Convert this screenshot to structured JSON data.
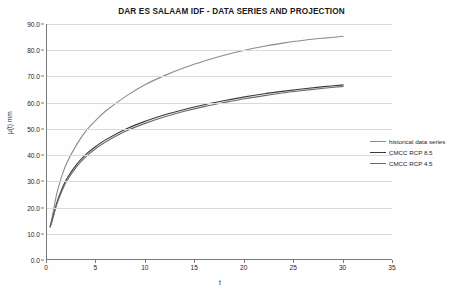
{
  "chart_data": {
    "type": "line",
    "title": "DAR ES SALAAM IDF - DATA SERIES AND PROJECTION",
    "xlabel": "t",
    "ylabel": "μ(t)  mm",
    "xlim": [
      0,
      35
    ],
    "ylim": [
      0,
      90
    ],
    "xticks": [
      0,
      5,
      10,
      15,
      20,
      25,
      30,
      35
    ],
    "yticks": [
      0.0,
      10.0,
      20.0,
      30.0,
      40.0,
      50.0,
      60.0,
      70.0,
      80.0,
      90.0
    ],
    "ytick_labels": [
      "0.0",
      "10.0",
      "20.0",
      "30.0",
      "40.0",
      "50.0",
      "60.0",
      "70.0",
      "80.0",
      "90.0"
    ],
    "xtick_labels": [
      "0",
      "5",
      "10",
      "15",
      "20",
      "25",
      "30",
      "35"
    ],
    "grid": "horizontal",
    "legend_position": "right-middle",
    "series": [
      {
        "name": "historical data series",
        "color": "#8c8c8c",
        "x": [
          0.3,
          0.5,
          1,
          1.5,
          2,
          3,
          4,
          5,
          6,
          8,
          10,
          12,
          14,
          16,
          18,
          20,
          22,
          24,
          26,
          28,
          30
        ],
        "values": [
          12.5,
          16.0,
          25.5,
          32.0,
          37.0,
          44.0,
          49.5,
          53.5,
          57.0,
          62.5,
          67.0,
          70.5,
          73.5,
          76.0,
          78.2,
          80.0,
          81.5,
          82.8,
          83.8,
          84.6,
          85.3
        ]
      },
      {
        "name": "CMCC RCP 8.5",
        "color": "#3a3a3a",
        "x": [
          0.3,
          0.5,
          1,
          1.5,
          2,
          3,
          4,
          5,
          6,
          8,
          10,
          12,
          14,
          16,
          18,
          20,
          22,
          24,
          26,
          28,
          30
        ],
        "values": [
          12.5,
          15.0,
          22.0,
          27.0,
          31.0,
          36.5,
          40.5,
          43.5,
          46.0,
          50.0,
          53.0,
          55.5,
          57.5,
          59.3,
          60.8,
          62.2,
          63.4,
          64.4,
          65.3,
          66.1,
          66.8
        ]
      },
      {
        "name": "CMCC RCP 4.5",
        "color": "#6b6b6b",
        "x": [
          0.3,
          0.5,
          1,
          1.5,
          2,
          3,
          4,
          5,
          6,
          8,
          10,
          12,
          14,
          16,
          18,
          20,
          22,
          24,
          26,
          28,
          30
        ],
        "values": [
          12.5,
          14.6,
          21.3,
          26.2,
          30.1,
          35.6,
          39.6,
          42.7,
          45.2,
          49.2,
          52.2,
          54.7,
          56.8,
          58.6,
          60.1,
          61.5,
          62.7,
          63.8,
          64.7,
          65.5,
          66.2
        ]
      }
    ]
  }
}
